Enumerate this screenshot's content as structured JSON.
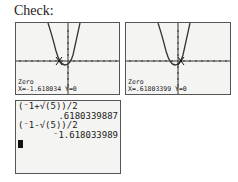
{
  "title": "Check:",
  "graphs": [
    {
      "status_label": "Zero",
      "x_label": "X=",
      "x_value": "-1.618034",
      "y_label": "Y=0",
      "cursor_x": -1.618
    },
    {
      "status_label": "Zero",
      "x_label": "X=",
      "x_value": ".61803399",
      "y_label": "Y=0",
      "cursor_x": 0.618
    }
  ],
  "home_screen": {
    "lines": [
      {
        "text": "(-1+√(5))/2",
        "align": "left"
      },
      {
        "text": ".61803398​87",
        "align": "right"
      },
      {
        "text": "(-1-√(5))/2",
        "align": "left"
      },
      {
        "text": "-1.618033989",
        "align": "right"
      }
    ],
    "expr1": "(⁻1+√(5))/2",
    "result1": ".6180339887",
    "expr2": "(⁻1-√(5))/2",
    "result2": "⁻1.618033989"
  },
  "colors": {
    "screen_bg": "#f4f4f2",
    "ink": "#222222",
    "border": "#555555"
  }
}
